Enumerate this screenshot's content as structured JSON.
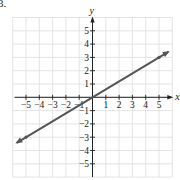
{
  "problem_label": "3.",
  "chart_data": {
    "type": "line",
    "title": "",
    "xlabel": "x",
    "ylabel": "y",
    "xlim": [
      -6,
      6
    ],
    "ylim": [
      -6,
      6
    ],
    "grid": true,
    "x_ticks": [
      -5,
      -4,
      -3,
      -2,
      -1,
      1,
      2,
      3,
      4,
      5
    ],
    "y_ticks": [
      -5,
      -4,
      -3,
      -2,
      -1,
      1,
      2,
      3,
      4,
      5
    ],
    "x_tick_labels": [
      "−5",
      "−4",
      "−3",
      "−2",
      "−1",
      "1",
      "2",
      "3",
      "4",
      "5"
    ],
    "y_tick_labels": [
      "−5",
      "−4",
      "−3",
      "−2",
      "−1",
      "1",
      "2",
      "3",
      "4",
      "5"
    ],
    "series": [
      {
        "name": "line",
        "equation": "y = (3/5)x",
        "slope": 0.6,
        "intercept": 0,
        "x": [
          -5.7,
          -5,
          0,
          5,
          5.7
        ],
        "y": [
          -3.42,
          -3,
          0,
          3,
          3.42
        ],
        "marked_points": [
          [
            -5,
            -3
          ],
          [
            5,
            3
          ]
        ],
        "arrows_both_ends": true
      }
    ],
    "colors": {
      "line": "#555555",
      "grid": "#dddddd",
      "axes": "#222222"
    }
  }
}
